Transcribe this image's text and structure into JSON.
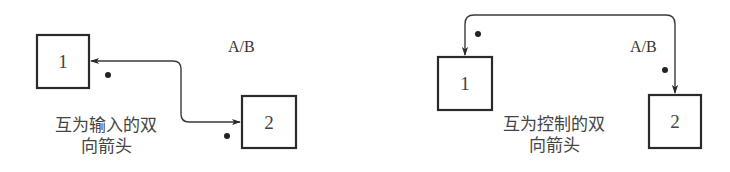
{
  "diagrams": [
    {
      "name": "mutual-input",
      "label": "A/B",
      "nodes": [
        {
          "id": "1",
          "label": "1"
        },
        {
          "id": "2",
          "label": "2"
        }
      ],
      "caption_line1": "互为输入的双",
      "caption_line2": "向箭头"
    },
    {
      "name": "mutual-control",
      "label": "A/B",
      "nodes": [
        {
          "id": "1",
          "label": "1"
        },
        {
          "id": "2",
          "label": "2"
        }
      ],
      "caption_line1": "互为控制的双",
      "caption_line2": "向箭头"
    }
  ],
  "colors": {
    "stroke": "#2a2a2a",
    "text": "#444444",
    "background": "#ffffff"
  }
}
